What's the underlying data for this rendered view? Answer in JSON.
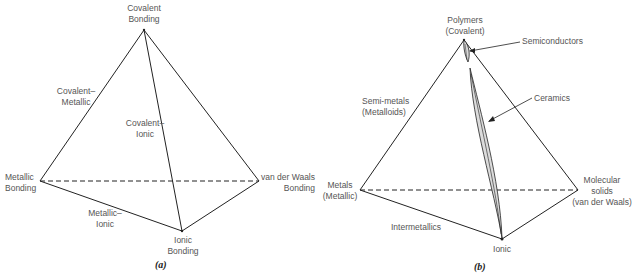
{
  "diagrams": [
    {
      "id": "a",
      "caption": "(a)",
      "vertices": {
        "top": [
          "Covalent",
          "Bonding"
        ],
        "left": [
          "Metallic",
          "Bonding"
        ],
        "right": [
          "van der Waals",
          "Bonding"
        ],
        "bottom": [
          "Ionic",
          "Bonding"
        ]
      },
      "edges": {
        "top_left": [
          "Covalent–",
          "Metallic"
        ],
        "top_bottom": [
          "Covalent–",
          "Ionic"
        ],
        "left_bottom": [
          "Metallic–",
          "Ionic"
        ]
      }
    },
    {
      "id": "b",
      "caption": "(b)",
      "vertices": {
        "top": [
          "Polymers",
          "(Covalent)"
        ],
        "left": [
          "Metals",
          "(Metallic)"
        ],
        "right": [
          "Molecular",
          "solids",
          "(van der Waals)"
        ],
        "bottom": [
          "Ionic"
        ]
      },
      "edges": {
        "top_left": [
          "Semi-metals",
          "(Metalloids)"
        ],
        "left_bottom": [
          "Intermetallics"
        ]
      },
      "regions": {
        "semiconductors": "Semiconductors",
        "ceramics": "Ceramics"
      }
    }
  ],
  "colors": {
    "line": "#222222",
    "label": "#555555",
    "region_fill": "#dcdcdc"
  }
}
